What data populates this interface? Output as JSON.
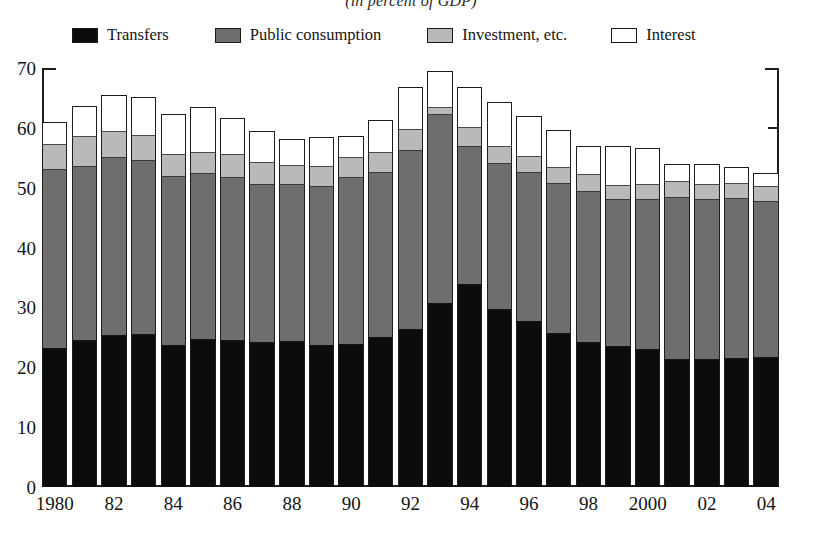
{
  "chart_data": {
    "type": "bar",
    "stacked": true,
    "title": "(in percent of GDP)",
    "xlabel": "",
    "ylabel": "",
    "ylim": [
      0,
      70
    ],
    "yticks": [
      0,
      10,
      20,
      30,
      40,
      50,
      60,
      70
    ],
    "grid": false,
    "legend_position": "top",
    "categories": [
      "1980",
      "1981",
      "1982",
      "1983",
      "1984",
      "1985",
      "1986",
      "1987",
      "1988",
      "1989",
      "1990",
      "1991",
      "1992",
      "1993",
      "1994",
      "1995",
      "1996",
      "1997",
      "1998",
      "1999",
      "2000",
      "2001",
      "2002",
      "2003",
      "2004"
    ],
    "x_tick_labels": [
      {
        "category": "1980",
        "label": "1980"
      },
      {
        "category": "1982",
        "label": "82"
      },
      {
        "category": "1984",
        "label": "84"
      },
      {
        "category": "1986",
        "label": "86"
      },
      {
        "category": "1988",
        "label": "88"
      },
      {
        "category": "1990",
        "label": "90"
      },
      {
        "category": "1992",
        "label": "92"
      },
      {
        "category": "1994",
        "label": "94"
      },
      {
        "category": "1996",
        "label": "96"
      },
      {
        "category": "1998",
        "label": "98"
      },
      {
        "category": "2000",
        "label": "2000"
      },
      {
        "category": "2002",
        "label": "02"
      },
      {
        "category": "2004",
        "label": "04"
      }
    ],
    "series": [
      {
        "name": "Transfers",
        "color": "#0c0c0c",
        "values": [
          23.0,
          24.4,
          25.3,
          25.4,
          23.6,
          24.5,
          24.4,
          24.0,
          24.2,
          23.6,
          23.7,
          24.9,
          26.3,
          30.6,
          33.8,
          29.5,
          27.5,
          25.6,
          24.1,
          23.4,
          22.9,
          21.2,
          21.2,
          21.4,
          21.6
        ]
      },
      {
        "name": "Public consumption",
        "color": "#6e6e6e",
        "values": [
          30.0,
          29.1,
          29.7,
          29.0,
          28.2,
          27.8,
          27.3,
          26.5,
          26.2,
          26.6,
          27.9,
          27.5,
          29.8,
          31.5,
          23.0,
          24.4,
          24.9,
          25.1,
          25.2,
          24.5,
          25.0,
          27.1,
          26.8,
          26.7,
          26.0
        ]
      },
      {
        "name": "Investment, etc.",
        "color": "#b9b9b9",
        "values": [
          4.2,
          4.9,
          4.3,
          4.2,
          3.7,
          3.5,
          3.8,
          3.6,
          3.3,
          3.3,
          3.3,
          3.4,
          3.6,
          1.3,
          3.1,
          2.9,
          2.7,
          2.6,
          2.8,
          2.4,
          2.6,
          2.7,
          2.5,
          2.5,
          2.5
        ]
      },
      {
        "name": "Interest",
        "color": "#ffffff",
        "values": [
          3.8,
          5.2,
          6.2,
          6.5,
          6.8,
          7.7,
          6.1,
          5.4,
          4.4,
          4.9,
          3.7,
          5.6,
          7.2,
          6.1,
          7.0,
          7.5,
          6.9,
          6.3,
          4.9,
          6.6,
          6.1,
          3.0,
          3.5,
          2.8,
          2.4
        ]
      }
    ],
    "legend_entries": [
      {
        "label": "Transfers",
        "color": "#0c0c0c"
      },
      {
        "label": "Public consumption",
        "color": "#6e6e6e"
      },
      {
        "label": "Investment, etc.",
        "color": "#b9b9b9"
      },
      {
        "label": "Interest",
        "color": "#ffffff"
      }
    ],
    "totals": [
      61.0,
      63.6,
      65.5,
      65.1,
      62.3,
      63.5,
      61.6,
      59.5,
      58.1,
      58.4,
      58.6,
      61.4,
      66.9,
      69.5,
      66.9,
      64.3,
      62.0,
      59.6,
      57.0,
      56.9,
      56.6,
      54.0,
      54.0,
      53.4,
      52.5
    ]
  }
}
